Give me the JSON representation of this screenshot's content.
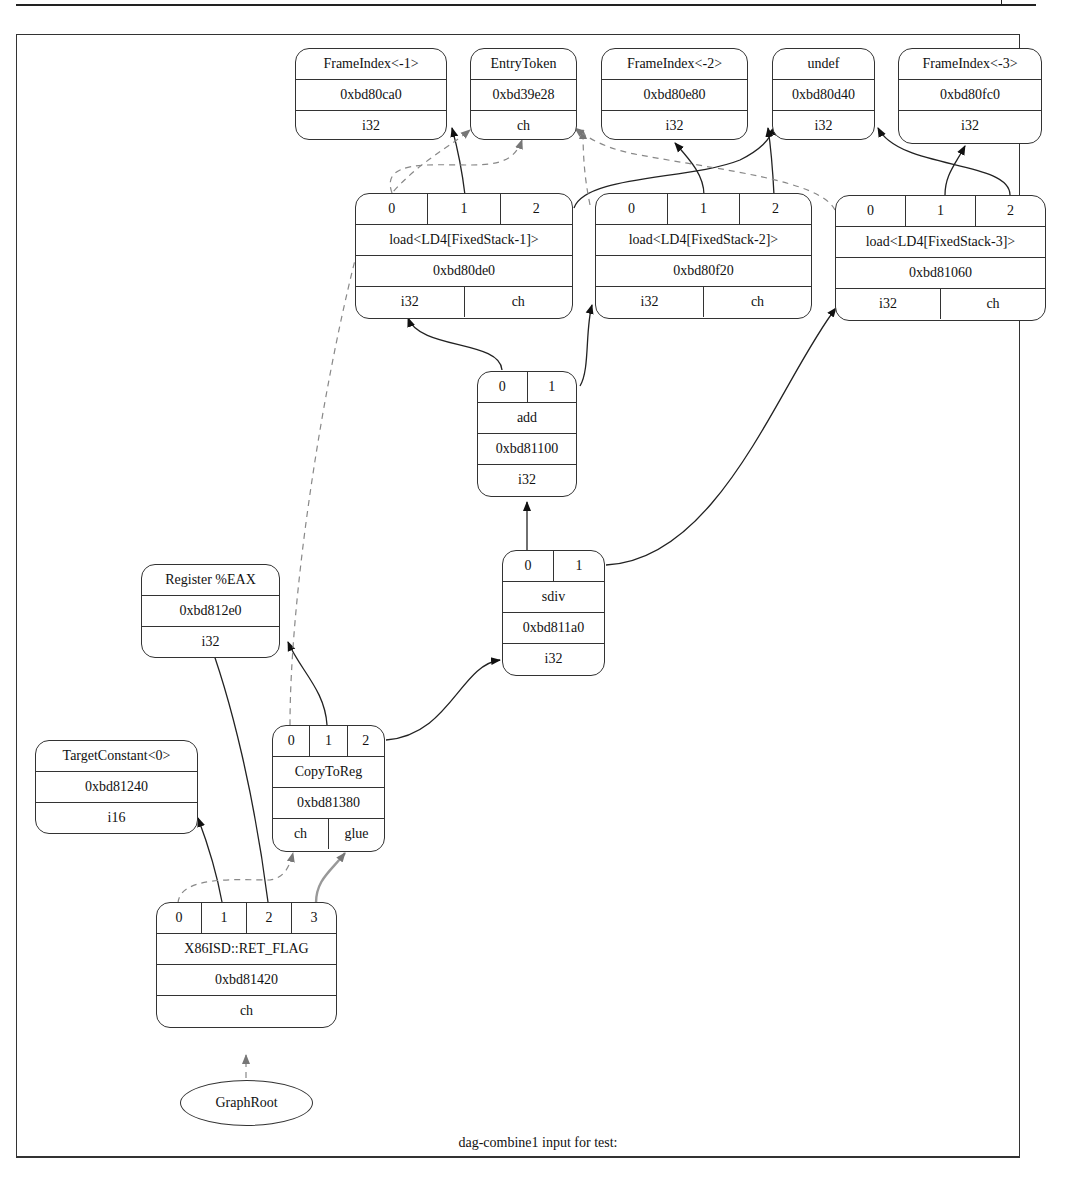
{
  "diagram": {
    "caption": "dag-combine1 input for test:",
    "nodes": {
      "frameindex_m1": {
        "title": "FrameIndex<-1>",
        "addr": "0xbd80ca0",
        "type": "i32"
      },
      "entrytoken": {
        "title": "EntryToken",
        "addr": "0xbd39e28",
        "type": "ch"
      },
      "frameindex_m2": {
        "title": "FrameIndex<-2>",
        "addr": "0xbd80e80",
        "type": "i32"
      },
      "undef": {
        "title": "undef",
        "addr": "0xbd80d40",
        "type": "i32"
      },
      "frameindex_m3": {
        "title": "FrameIndex<-3>",
        "addr": "0xbd80fc0",
        "type": "i32"
      },
      "load1": {
        "ops": [
          "0",
          "1",
          "2"
        ],
        "title": "load<LD4[FixedStack-1]>",
        "addr": "0xbd80de0",
        "types": [
          "i32",
          "ch"
        ]
      },
      "load2": {
        "ops": [
          "0",
          "1",
          "2"
        ],
        "title": "load<LD4[FixedStack-2]>",
        "addr": "0xbd80f20",
        "types": [
          "i32",
          "ch"
        ]
      },
      "load3": {
        "ops": [
          "0",
          "1",
          "2"
        ],
        "title": "load<LD4[FixedStack-3]>",
        "addr": "0xbd81060",
        "types": [
          "i32",
          "ch"
        ]
      },
      "add": {
        "ops": [
          "0",
          "1"
        ],
        "title": "add",
        "addr": "0xbd81100",
        "type": "i32"
      },
      "sdiv": {
        "ops": [
          "0",
          "1"
        ],
        "title": "sdiv",
        "addr": "0xbd811a0",
        "type": "i32"
      },
      "register_eax": {
        "title": "Register %EAX",
        "addr": "0xbd812e0",
        "type": "i32"
      },
      "copytoreg": {
        "ops": [
          "0",
          "1",
          "2"
        ],
        "title": "CopyToReg",
        "addr": "0xbd81380",
        "types": [
          "ch",
          "glue"
        ]
      },
      "targetconstant": {
        "title": "TargetConstant<0>",
        "addr": "0xbd81240",
        "type": "i16"
      },
      "ret_flag": {
        "ops": [
          "0",
          "1",
          "2",
          "3"
        ],
        "title": "X86ISD::RET_FLAG",
        "addr": "0xbd81420",
        "type": "ch"
      },
      "graphroot": {
        "title": "GraphRoot"
      }
    },
    "edges": [
      {
        "from": "load1.1",
        "to": "frameindex_m1",
        "style": "solid"
      },
      {
        "from": "load1.2",
        "to": "undef",
        "style": "solid"
      },
      {
        "from": "load1.0",
        "to": "entrytoken",
        "style": "dashed"
      },
      {
        "from": "load2.1",
        "to": "frameindex_m2",
        "style": "solid"
      },
      {
        "from": "load2.2",
        "to": "undef",
        "style": "solid"
      },
      {
        "from": "load2.0",
        "to": "entrytoken",
        "style": "dashed"
      },
      {
        "from": "load3.1",
        "to": "frameindex_m3",
        "style": "solid"
      },
      {
        "from": "load3.2",
        "to": "undef",
        "style": "solid"
      },
      {
        "from": "load3.0",
        "to": "entrytoken",
        "style": "dashed"
      },
      {
        "from": "add.0",
        "to": "load1",
        "style": "solid"
      },
      {
        "from": "add.1",
        "to": "load2",
        "style": "solid"
      },
      {
        "from": "sdiv.0",
        "to": "add",
        "style": "solid"
      },
      {
        "from": "sdiv.1",
        "to": "load3",
        "style": "solid"
      },
      {
        "from": "copytoreg.0",
        "to": "entrytoken",
        "style": "dashed"
      },
      {
        "from": "copytoreg.1",
        "to": "register_eax",
        "style": "solid"
      },
      {
        "from": "copytoreg.2",
        "to": "sdiv",
        "style": "solid"
      },
      {
        "from": "ret_flag.0",
        "to": "copytoreg",
        "style": "dashed"
      },
      {
        "from": "ret_flag.1",
        "to": "targetconstant",
        "style": "solid"
      },
      {
        "from": "ret_flag.2",
        "to": "register_eax",
        "style": "solid"
      },
      {
        "from": "ret_flag.3",
        "to": "copytoreg.glue",
        "style": "glue"
      },
      {
        "from": "graphroot",
        "to": "ret_flag",
        "style": "dashed"
      }
    ]
  }
}
